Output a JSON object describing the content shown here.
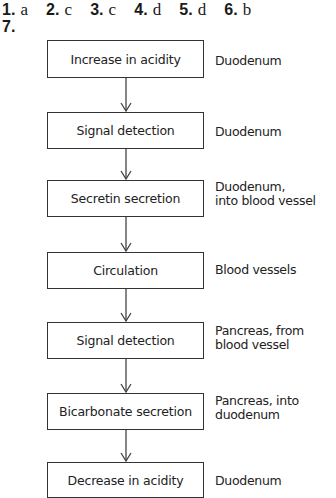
{
  "answers": [
    {
      "num": "1.",
      "value": "a"
    },
    {
      "num": "2.",
      "value": "c"
    },
    {
      "num": "3.",
      "value": "c"
    },
    {
      "num": "4.",
      "value": "d"
    },
    {
      "num": "5.",
      "value": "d"
    },
    {
      "num": "6.",
      "value": "b"
    }
  ],
  "question7": {
    "num": "7.",
    "flowchart": [
      {
        "step": "Increase in acidity",
        "location": [
          "Duodenum"
        ]
      },
      {
        "step": "Signal detection",
        "location": [
          "Duodenum"
        ]
      },
      {
        "step": "Secretin secretion",
        "location": [
          "Duodenum,",
          "into blood vessel"
        ]
      },
      {
        "step": "Circulation",
        "location": [
          "Blood vessels"
        ]
      },
      {
        "step": "Signal detection",
        "location": [
          "Pancreas, from",
          "blood vessel"
        ]
      },
      {
        "step": "Bicarbonate secretion",
        "location": [
          "Pancreas, into",
          "duodenum"
        ]
      },
      {
        "step": "Decrease in acidity",
        "location": [
          "Duodenum"
        ]
      }
    ]
  }
}
